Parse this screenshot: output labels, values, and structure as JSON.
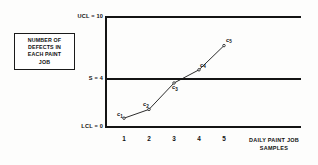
{
  "caption": {
    "lines": [
      "NUMBER OF",
      "DEFECTS IN",
      "EACH PAINT",
      "JOB"
    ]
  },
  "axis": {
    "ucl_label": "UCL = 10",
    "center_label": "S = 4",
    "lcl_label": "LCL = 0",
    "x_title_line1": "DAILY PAINT JOB",
    "x_title_line2": "SAMPLES"
  },
  "points": [
    {
      "label": "c",
      "sub": "1"
    },
    {
      "label": "c",
      "sub": "2"
    },
    {
      "label": "c",
      "sub": "3"
    },
    {
      "label": "c",
      "sub": "4"
    },
    {
      "label": "c",
      "sub": "5"
    }
  ],
  "ticks": [
    "1",
    "2",
    "3",
    "4",
    "5"
  ],
  "colors": {
    "line": "#141414",
    "text": "#111111",
    "background": "#fdfdfc"
  },
  "chart_data": {
    "type": "line",
    "title": "",
    "subtitle": "",
    "xlabel": "DAILY PAINT JOB SAMPLES",
    "ylabel": "NUMBER OF DEFECTS IN EACH PAINT JOB",
    "x": [
      1,
      2,
      3,
      4,
      5
    ],
    "xtick_labels": [
      "1",
      "2",
      "3",
      "4",
      "5"
    ],
    "values": [
      0.8,
      1.6,
      4.0,
      5.2,
      7.4
    ],
    "point_labels": [
      "c1",
      "c2",
      "c3",
      "c4",
      "c5"
    ],
    "ylim": [
      0,
      10
    ],
    "xlim": [
      0,
      6
    ],
    "grid": false,
    "legend": "none",
    "control_limits": {
      "upper_control_limit": 10,
      "center_line": 4,
      "lower_control_limit": 0
    },
    "annotations": [
      "UCL = 10",
      "S = 4",
      "LCL = 0"
    ]
  }
}
